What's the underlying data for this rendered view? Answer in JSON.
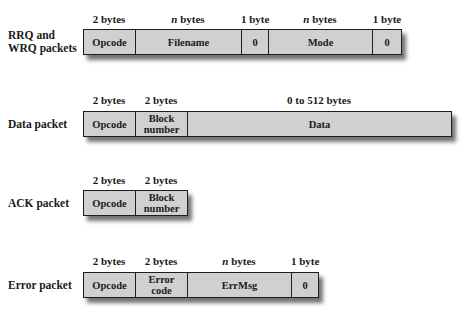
{
  "packets": [
    {
      "label_line1": "RRQ and",
      "label_line2": "WRQ packets",
      "fields": [
        {
          "name": "Opcode",
          "size_num": "2",
          "size_unit": " bytes"
        },
        {
          "name": "Filename",
          "size_num": "n",
          "size_unit": " bytes"
        },
        {
          "name": "0",
          "size_num": "1",
          "size_unit": " byte"
        },
        {
          "name": "Mode",
          "size_num": "n",
          "size_unit": " bytes"
        },
        {
          "name": "0",
          "size_num": "1",
          "size_unit": " byte"
        }
      ]
    },
    {
      "label_line1": "Data packet",
      "fields": [
        {
          "name": "Opcode",
          "size_num": "2",
          "size_unit": " bytes"
        },
        {
          "name_line1": "Block",
          "name_line2": "number",
          "size_num": "2",
          "size_unit": " bytes"
        },
        {
          "name": "Data",
          "size_num": "0 to 512",
          "size_unit": " bytes"
        }
      ]
    },
    {
      "label_line1": "ACK packet",
      "fields": [
        {
          "name": "Opcode",
          "size_num": "2",
          "size_unit": " bytes"
        },
        {
          "name_line1": "Block",
          "name_line2": "number",
          "size_num": "2",
          "size_unit": " bytes"
        }
      ]
    },
    {
      "label_line1": "Error packet",
      "fields": [
        {
          "name": "Opcode",
          "size_num": "2",
          "size_unit": " bytes"
        },
        {
          "name_line1": "Error",
          "name_line2": "code",
          "size_num": "2",
          "size_unit": " bytes"
        },
        {
          "name": "ErrMsg",
          "size_num": "n",
          "size_unit": " bytes"
        },
        {
          "name": "0",
          "size_num": "1",
          "size_unit": " byte"
        }
      ]
    }
  ],
  "colors": {
    "field_fill": "#d0d0d0",
    "border": "#1e1e1e",
    "background": "#ffffff"
  }
}
